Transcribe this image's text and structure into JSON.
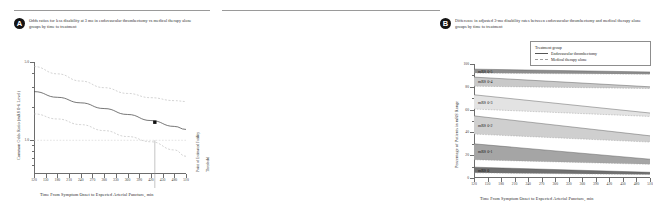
{
  "panels": {
    "a": {
      "badge": "A",
      "caption": "Odds ratios for less disability at 3 mo in endovascular thrombectomy vs medical therapy alone groups by time to treatment",
      "ylabel": "Common Odds Ratio (mRS 0-6 Level)",
      "xlabel": "Time From Symptom Onset to Expected Arterial Puncture, min",
      "note_futility": "Point of Estimated Futility",
      "note_threshold": "Threshold"
    },
    "b": {
      "badge": "B",
      "caption": "Difference in adjusted 3-mo disability rates between endovascular thrombectomy and medical therapy alone groups by time to treatment",
      "ylabel": "Percentage of Patients in mRS Range",
      "xlabel": "Time From Symptom Onset to Expected Arterial Puncture, min",
      "legend": {
        "title": "Treatment group",
        "items": [
          {
            "label": "Endovascular thrombectomy",
            "style": "solid",
            "color": "#555555"
          },
          {
            "label": "Medical therapy alone",
            "style": "dashed",
            "color": "#9e9e9e"
          }
        ]
      },
      "band_labels": [
        "mRS 0-5",
        "mRS 0-4",
        "mRS 0-3",
        "mRS 0-2",
        "mRS 0-1",
        "mRS 0"
      ]
    }
  },
  "chart_data": [
    {
      "type": "line",
      "panel": "A",
      "title": "Odds ratios for less disability at 3 mo in endovascular thrombectomy vs medical therapy alone groups by time to treatment",
      "xlabel": "Time From Symptom Onset to Expected Arterial Puncture, min",
      "ylabel": "Common Odds Ratio (mRS 0-6 Level)",
      "xlim": [
        120,
        510
      ],
      "ylim": [
        0.5,
        5.0
      ],
      "yscale": "log",
      "yticks": [
        1.0,
        5.0
      ],
      "ytick_labels": [
        "1.0",
        "5.0"
      ],
      "xticks": [
        120,
        150,
        180,
        210,
        240,
        270,
        300,
        330,
        360,
        390,
        420,
        450,
        480,
        510
      ],
      "grid": false,
      "reference_line_y": 1.0,
      "vertical_marker_x": 430,
      "point_marker": {
        "x": 430,
        "y": 1.45,
        "style": "filled-square",
        "color": "#111111"
      },
      "series": [
        {
          "name": "Common odds ratio",
          "style": "solid",
          "color": "#4a4a4a",
          "x": [
            120,
            180,
            240,
            300,
            360,
            420,
            480,
            510
          ],
          "y": [
            2.72,
            2.42,
            2.16,
            1.92,
            1.7,
            1.5,
            1.33,
            1.25
          ]
        },
        {
          "name": "Upper 95% CI",
          "style": "dashed",
          "color": "#b0b0b0",
          "x": [
            120,
            180,
            240,
            300,
            360,
            420,
            480,
            510
          ],
          "y": [
            4.55,
            3.92,
            3.38,
            2.95,
            2.62,
            2.4,
            2.26,
            2.22
          ]
        },
        {
          "name": "Lower 95% CI",
          "style": "dashed",
          "color": "#b0b0b0",
          "x": [
            120,
            180,
            240,
            300,
            360,
            420,
            480,
            510
          ],
          "y": [
            1.72,
            1.55,
            1.38,
            1.22,
            1.08,
            0.97,
            0.82,
            0.72
          ]
        }
      ]
    },
    {
      "type": "area",
      "panel": "B",
      "title": "Difference in adjusted 3-mo disability rates between endovascular thrombectomy and medical therapy alone groups by time to treatment",
      "xlabel": "Time From Symptom Onset to Expected Arterial Puncture, min",
      "ylabel": "Percentage of Patients in mRS Range",
      "xlim": [
        120,
        510
      ],
      "ylim": [
        0,
        100
      ],
      "yticks": [
        0,
        20,
        40,
        60,
        80,
        100
      ],
      "ytick_labels": [
        "0",
        "20",
        "40",
        "60",
        "80",
        "100"
      ],
      "xticks": [
        120,
        150,
        180,
        210,
        240,
        270,
        300,
        330,
        360,
        390,
        420,
        450,
        480,
        510
      ],
      "grid": false,
      "bands": [
        {
          "name": "mRS 0-5",
          "fill": "#8d8d8d",
          "thrombectomy": {
            "x": [
              120,
              510
            ],
            "y": [
              95.5,
              93.0
            ]
          },
          "medical": {
            "x": [
              120,
              510
            ],
            "y": [
              92.0,
              91.0
            ]
          }
        },
        {
          "name": "mRS 0-4",
          "fill": "#c9c9c9",
          "thrombectomy": {
            "x": [
              120,
              510
            ],
            "y": [
              88.5,
              80.0
            ]
          },
          "medical": {
            "x": [
              120,
              510
            ],
            "y": [
              80.5,
              78.5
            ]
          }
        },
        {
          "name": "mRS 0-3",
          "fill": "#e3e3e3",
          "thrombectomy": {
            "x": [
              120,
              510
            ],
            "y": [
              73.0,
              57.0
            ]
          },
          "medical": {
            "x": [
              120,
              510
            ],
            "y": [
              60.5,
              54.0
            ]
          }
        },
        {
          "name": "mRS 0-2",
          "fill": "#cfcfcf",
          "thrombectomy": {
            "x": [
              120,
              510
            ],
            "y": [
              54.5,
              37.0
            ]
          },
          "medical": {
            "x": [
              120,
              510
            ],
            "y": [
              38.5,
              31.5
            ]
          }
        },
        {
          "name": "mRS 0-1",
          "fill": "#a5a5a5",
          "thrombectomy": {
            "x": [
              120,
              510
            ],
            "y": [
              30.0,
              16.5
            ]
          },
          "medical": {
            "x": [
              120,
              510
            ],
            "y": [
              16.0,
              12.0
            ]
          }
        },
        {
          "name": "mRS 0",
          "fill": "#6f6f6f",
          "thrombectomy": {
            "x": [
              120,
              510
            ],
            "y": [
              9.5,
              5.0
            ]
          },
          "medical": {
            "x": [
              120,
              510
            ],
            "y": [
              4.5,
              3.0
            ]
          }
        }
      ]
    }
  ]
}
